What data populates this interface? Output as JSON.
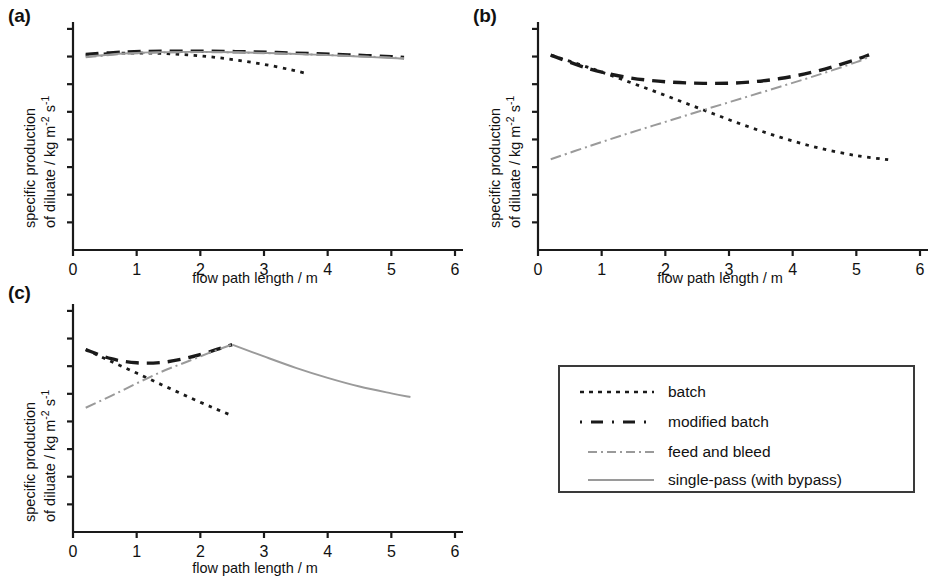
{
  "figure": {
    "panel_labels": {
      "a": "(a)",
      "b": "(b)",
      "c": "(c)"
    },
    "axis": {
      "xlabel": "flow path length / m",
      "ylabel_line1": "specific production",
      "ylabel_line2": "of diluate / kg m",
      "ylabel_sup1": "-2",
      "ylabel_mid": " s",
      "ylabel_sup2": "-1",
      "xticks": [
        "0",
        "1",
        "2",
        "3",
        "4",
        "5",
        "6"
      ]
    }
  },
  "legend": {
    "items": [
      {
        "label": "batch",
        "style": "dotted",
        "color": "#1a1a1a"
      },
      {
        "label": "modified batch",
        "style": "dashed",
        "color": "#1a1a1a"
      },
      {
        "label": "feed and bleed",
        "style": "dashdot",
        "color": "#9a9a9a"
      },
      {
        "label": "single-pass (with bypass)",
        "style": "solid",
        "color": "#9a9a9a"
      }
    ]
  },
  "colors": {
    "axis": "#1a1a1a",
    "dark_series": "#1a1a1a",
    "gray_series": "#9a9a9a",
    "legend_border": "#3a3a3a"
  },
  "chart_data": [
    {
      "type": "line",
      "panel": "(a)",
      "title": "",
      "xlabel": "flow path length / m",
      "ylabel": "specific production of diluate / kg m-2 s-1",
      "xlim": [
        0,
        6
      ],
      "ylim": [
        0,
        1
      ],
      "xticks": [
        0,
        1,
        2,
        3,
        4,
        5,
        6
      ],
      "yticks_count": 8,
      "ytick_labels": [],
      "grid": false,
      "series": [
        {
          "name": "batch",
          "style": "dotted",
          "color": "#1a1a1a",
          "x": [
            0.2,
            0.6,
            1.0,
            1.4,
            1.8,
            2.2,
            2.6,
            3.0,
            3.4,
            3.7
          ],
          "y": [
            0.855,
            0.862,
            0.864,
            0.862,
            0.856,
            0.846,
            0.832,
            0.814,
            0.792,
            0.772
          ]
        },
        {
          "name": "modified batch",
          "style": "dashed",
          "color": "#1a1a1a",
          "x": [
            0.2,
            0.8,
            1.4,
            2.0,
            2.6,
            3.2,
            3.8,
            4.4,
            5.0,
            5.2
          ],
          "y": [
            0.858,
            0.868,
            0.872,
            0.872,
            0.87,
            0.866,
            0.861,
            0.855,
            0.848,
            0.845
          ]
        },
        {
          "name": "feed and bleed",
          "style": "dashdot",
          "color": "#9a9a9a",
          "x": [
            0.2,
            0.8,
            1.4,
            2.0,
            2.6,
            3.2,
            3.8,
            4.4,
            5.0,
            5.2
          ],
          "y": [
            0.845,
            0.86,
            0.866,
            0.868,
            0.866,
            0.862,
            0.857,
            0.851,
            0.844,
            0.841
          ]
        },
        {
          "name": "single-pass (with bypass)",
          "style": "solid",
          "color": "#9a9a9a",
          "x": [
            0.2,
            0.8,
            1.4,
            2.0,
            2.6,
            3.2,
            3.8,
            4.4,
            5.0,
            5.2
          ],
          "y": [
            0.848,
            0.862,
            0.868,
            0.869,
            0.867,
            0.863,
            0.857,
            0.85,
            0.842,
            0.838
          ]
        }
      ]
    },
    {
      "type": "line",
      "panel": "(b)",
      "title": "",
      "xlabel": "flow path length / m",
      "ylabel": "specific production of diluate / kg m-2 s-1",
      "xlim": [
        0,
        6
      ],
      "ylim": [
        0,
        1
      ],
      "xticks": [
        0,
        1,
        2,
        3,
        4,
        5,
        6
      ],
      "yticks_count": 8,
      "ytick_labels": [],
      "grid": false,
      "series": [
        {
          "name": "batch",
          "style": "dotted",
          "color": "#1a1a1a",
          "x": [
            0.2,
            0.8,
            1.4,
            2.0,
            2.6,
            3.2,
            3.8,
            4.4,
            5.0,
            5.5
          ],
          "y": [
            0.855,
            0.8,
            0.74,
            0.678,
            0.614,
            0.551,
            0.495,
            0.448,
            0.414,
            0.396
          ]
        },
        {
          "name": "modified batch",
          "style": "dashed",
          "color": "#1a1a1a",
          "x": [
            0.2,
            0.8,
            1.4,
            2.0,
            2.6,
            3.2,
            3.8,
            4.4,
            5.0,
            5.2
          ],
          "y": [
            0.855,
            0.795,
            0.757,
            0.738,
            0.731,
            0.734,
            0.752,
            0.786,
            0.836,
            0.856
          ]
        },
        {
          "name": "feed and bleed",
          "style": "dashdot",
          "color": "#9a9a9a",
          "x": [
            0.2,
            0.8,
            1.4,
            2.0,
            2.6,
            3.2,
            3.8,
            4.4,
            5.0,
            5.2
          ],
          "y": [
            0.398,
            0.455,
            0.51,
            0.562,
            0.614,
            0.665,
            0.716,
            0.768,
            0.824,
            0.848
          ]
        }
      ]
    },
    {
      "type": "line",
      "panel": "(c)",
      "title": "",
      "xlabel": "flow path length / m",
      "ylabel": "specific production of diluate / kg m-2 s-1",
      "xlim": [
        0,
        6
      ],
      "ylim": [
        0,
        1
      ],
      "xticks": [
        0,
        1,
        2,
        3,
        4,
        5,
        6
      ],
      "yticks_count": 8,
      "ytick_labels": [],
      "grid": false,
      "series": [
        {
          "name": "batch",
          "style": "dotted",
          "color": "#1a1a1a",
          "x": [
            0.2,
            0.6,
            1.0,
            1.4,
            1.8,
            2.2,
            2.5
          ],
          "y": [
            0.8,
            0.748,
            0.697,
            0.645,
            0.594,
            0.545,
            0.51
          ]
        },
        {
          "name": "modified batch",
          "style": "dashed",
          "color": "#1a1a1a",
          "x": [
            0.2,
            0.6,
            1.0,
            1.4,
            1.8,
            2.2,
            2.5
          ],
          "y": [
            0.8,
            0.76,
            0.742,
            0.744,
            0.764,
            0.795,
            0.822
          ]
        },
        {
          "name": "feed and bleed",
          "style": "dashdot",
          "color": "#9a9a9a",
          "x": [
            0.2,
            0.6,
            1.0,
            1.4,
            1.8,
            2.2,
            2.5
          ],
          "y": [
            0.545,
            0.597,
            0.652,
            0.704,
            0.748,
            0.792,
            0.822
          ]
        },
        {
          "name": "single-pass (with bypass)",
          "style": "solid",
          "color": "#9a9a9a",
          "x": [
            2.5,
            3.0,
            3.5,
            4.0,
            4.5,
            5.0,
            5.3
          ],
          "y": [
            0.822,
            0.77,
            0.72,
            0.676,
            0.638,
            0.608,
            0.592
          ]
        }
      ]
    }
  ]
}
